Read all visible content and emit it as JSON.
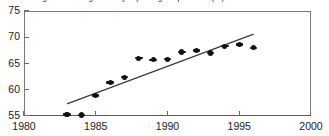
{
  "chart_data": {
    "type": "scatter",
    "title": "Changes in average weekly reporting frequencies (%) 1983-1996",
    "xlabel": "",
    "ylabel": "",
    "xlim": [
      1980,
      2000
    ],
    "ylim": [
      55,
      75
    ],
    "xticks": [
      1980,
      1985,
      1990,
      1995,
      2000
    ],
    "yticks": [
      55,
      60,
      65,
      70,
      75
    ],
    "xtick_labels": [
      "1980",
      "1985",
      "1990",
      "1995",
      "2000"
    ],
    "ytick_labels": [
      "55",
      "60",
      "65",
      "70",
      "75"
    ],
    "grid": false,
    "legend": false,
    "marker": "diamond",
    "marker_color": "#111111",
    "frame_color": "#6a6a6a",
    "x": [
      1983,
      1984,
      1985,
      1986,
      1987,
      1988,
      1989,
      1990,
      1991,
      1992,
      1993,
      1994,
      1995,
      1996
    ],
    "values": [
      55.3,
      55.2,
      58.9,
      61.4,
      62.4,
      66.0,
      65.7,
      65.8,
      67.2,
      67.5,
      67.0,
      68.3,
      68.6,
      68.0
    ],
    "series": [
      {
        "name": "Average weekly reporting frequency",
        "x": [
          1983,
          1984,
          1985,
          1986,
          1987,
          1988,
          1989,
          1990,
          1991,
          1992,
          1993,
          1994,
          1995,
          1996
        ],
        "values": [
          55.3,
          55.2,
          58.9,
          61.4,
          62.4,
          66.0,
          65.7,
          65.8,
          67.2,
          67.5,
          67.0,
          68.3,
          68.6,
          68.0
        ]
      },
      {
        "name": "Linear trend",
        "type": "line",
        "x": [
          1983,
          1996
        ],
        "values": [
          57.3,
          70.6
        ],
        "color": "#3a3a3a"
      }
    ],
    "trendline": {
      "x_start": 1983,
      "y_start": 57.3,
      "x_end": 1996,
      "y_end": 70.6,
      "color": "#3a3a3a"
    }
  }
}
